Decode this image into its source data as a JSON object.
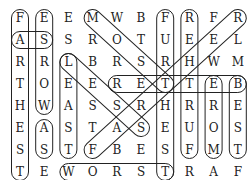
{
  "puzzle": {
    "rows": [
      [
        "F",
        "E",
        "E",
        "M",
        "W",
        "B",
        "F",
        "R",
        "F",
        "R"
      ],
      [
        "A",
        "S",
        "S",
        "R",
        "O",
        "T",
        "U",
        "E",
        "E",
        "L"
      ],
      [
        "R",
        "R",
        "L",
        "B",
        "R",
        "S",
        "R",
        "H",
        "W",
        "M"
      ],
      [
        "T",
        "O",
        "E",
        "E",
        "R",
        "E",
        "T",
        "T",
        "E",
        "B"
      ],
      [
        "H",
        "W",
        "A",
        "S",
        "S",
        "R",
        "H",
        "R",
        "R",
        "E"
      ],
      [
        "E",
        "A",
        "S",
        "T",
        "A",
        "S",
        "E",
        "U",
        "O",
        "S"
      ],
      [
        "S",
        "S",
        "T",
        "F",
        "B",
        "E",
        "S",
        "F",
        "M",
        "T"
      ],
      [
        "T",
        "E",
        "W",
        "O",
        "R",
        "S",
        "T",
        "R",
        "A",
        "F"
      ]
    ],
    "found_words": [
      {
        "word": "FARTHEST",
        "from": [
          0,
          0
        ],
        "to": [
          7,
          0
        ]
      },
      {
        "word": "AS",
        "from": [
          1,
          0
        ],
        "to": [
          1,
          1
        ]
      },
      {
        "word": "WORSE",
        "from": [
          4,
          1
        ],
        "to": [
          0,
          1
        ]
      },
      {
        "word": "AS",
        "from": [
          5,
          1
        ],
        "to": [
          6,
          1
        ]
      },
      {
        "word": "LEAST",
        "from": [
          2,
          2
        ],
        "to": [
          6,
          2
        ]
      },
      {
        "word": "MOST",
        "from": [
          0,
          3
        ],
        "to": [
          3,
          6
        ]
      },
      {
        "word": "LESS",
        "from": [
          2,
          2
        ],
        "to": [
          5,
          5
        ]
      },
      {
        "word": "BETTER",
        "from": [
          3,
          9
        ],
        "to": [
          3,
          4
        ]
      },
      {
        "word": "WORST",
        "from": [
          7,
          2
        ],
        "to": [
          7,
          6
        ]
      },
      {
        "word": "FURTHEST",
        "from": [
          0,
          6
        ],
        "to": [
          7,
          6
        ]
      },
      {
        "word": "FURTHER",
        "from": [
          6,
          7
        ],
        "to": [
          0,
          7
        ]
      },
      {
        "word": "MORE",
        "from": [
          6,
          8
        ],
        "to": [
          3,
          8
        ]
      },
      {
        "word": "BEST",
        "from": [
          3,
          9
        ],
        "to": [
          6,
          9
        ]
      },
      {
        "word": "FARTHER",
        "from": [
          6,
          3
        ],
        "to": [
          0,
          9
        ]
      }
    ]
  }
}
